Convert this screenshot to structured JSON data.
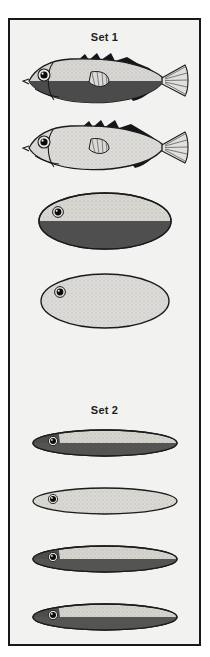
{
  "figure": {
    "title": "",
    "background_color": "#f2f2f0",
    "frame_color": "#18181a",
    "page_background": "#ffffff"
  },
  "sets": [
    {
      "id": "set-1",
      "label": "Set 1",
      "stimuli": [
        {
          "id": "stimulus-1",
          "name": "stickleback-fish-dark-belly",
          "shape": "fish",
          "detail": "full",
          "belly": "dark",
          "has_eye": true,
          "has_tail_fin": true,
          "has_pectoral_fin": true,
          "has_dorsal_spines": true,
          "body_fill": "#d8d6d2",
          "belly_fill": "#4b4b4b",
          "outline_color": "#1b1b1b"
        },
        {
          "id": "stimulus-2",
          "name": "stickleback-fish-light-belly",
          "shape": "fish",
          "detail": "full",
          "belly": "light",
          "has_eye": true,
          "has_tail_fin": true,
          "has_pectoral_fin": true,
          "has_dorsal_spines": true,
          "body_fill": "#dedcd8",
          "belly_fill": "#dedcd8",
          "outline_color": "#1b1b1b"
        },
        {
          "id": "stimulus-3",
          "name": "oval-model-dark-belly",
          "shape": "oval",
          "detail": "simple",
          "belly": "dark",
          "has_eye": true,
          "has_tail_fin": false,
          "has_pectoral_fin": false,
          "has_dorsal_spines": false,
          "body_fill": "#d9d7d2",
          "belly_fill": "#4f4f4f",
          "outline_color": "#1b1b1b"
        },
        {
          "id": "stimulus-4",
          "name": "oval-model-light-belly",
          "shape": "oval",
          "detail": "simple",
          "belly": "light",
          "has_eye": true,
          "has_tail_fin": false,
          "has_pectoral_fin": false,
          "has_dorsal_spines": false,
          "body_fill": "#dddbd7",
          "belly_fill": "#dddbd7",
          "outline_color": "#1b1b1b"
        }
      ]
    },
    {
      "id": "set-2",
      "label": "Set 2",
      "stimuli": [
        {
          "id": "stimulus-5",
          "name": "slender-model-dark-belly-a",
          "shape": "slender-oval",
          "detail": "simple",
          "belly": "dark",
          "has_eye": true,
          "has_tail_fin": false,
          "has_pectoral_fin": false,
          "has_dorsal_spines": false,
          "body_fill": "#d6d4cf",
          "belly_fill": "#545452",
          "outline_color": "#1b1b1b"
        },
        {
          "id": "stimulus-6",
          "name": "slender-model-light-belly",
          "shape": "slender-oval",
          "detail": "simple",
          "belly": "light",
          "has_eye": true,
          "has_tail_fin": false,
          "has_pectoral_fin": false,
          "has_dorsal_spines": false,
          "body_fill": "#dbd9d4",
          "belly_fill": "#dbd9d4",
          "outline_color": "#1b1b1b"
        },
        {
          "id": "stimulus-7",
          "name": "slender-model-dark-belly-b",
          "shape": "slender-oval",
          "detail": "simple",
          "belly": "dark",
          "has_eye": true,
          "has_tail_fin": false,
          "has_pectoral_fin": false,
          "has_dorsal_spines": false,
          "body_fill": "#d6d4cf",
          "belly_fill": "#545452",
          "outline_color": "#1b1b1b"
        },
        {
          "id": "stimulus-8",
          "name": "slender-model-dark-belly-c",
          "shape": "slender-oval",
          "detail": "simple",
          "belly": "dark",
          "has_eye": true,
          "has_tail_fin": false,
          "has_pectoral_fin": false,
          "has_dorsal_spines": false,
          "body_fill": "#d6d4cf",
          "belly_fill": "#545452",
          "outline_color": "#1b1b1b"
        }
      ]
    }
  ]
}
